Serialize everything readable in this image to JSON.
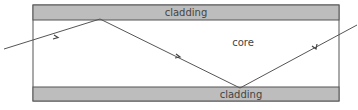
{
  "diagram": {
    "labels": {
      "top_cladding": "cladding",
      "core": "core",
      "bottom_cladding": "cladding"
    },
    "colors": {
      "cladding_fill": "#bdbdbd",
      "outline": "#555555",
      "ray": "#555555",
      "core_fill": "#ffffff"
    },
    "ray_points": [
      [
        4,
        49
      ],
      [
        100,
        19
      ],
      [
        240,
        88
      ],
      [
        357,
        25
      ]
    ]
  }
}
